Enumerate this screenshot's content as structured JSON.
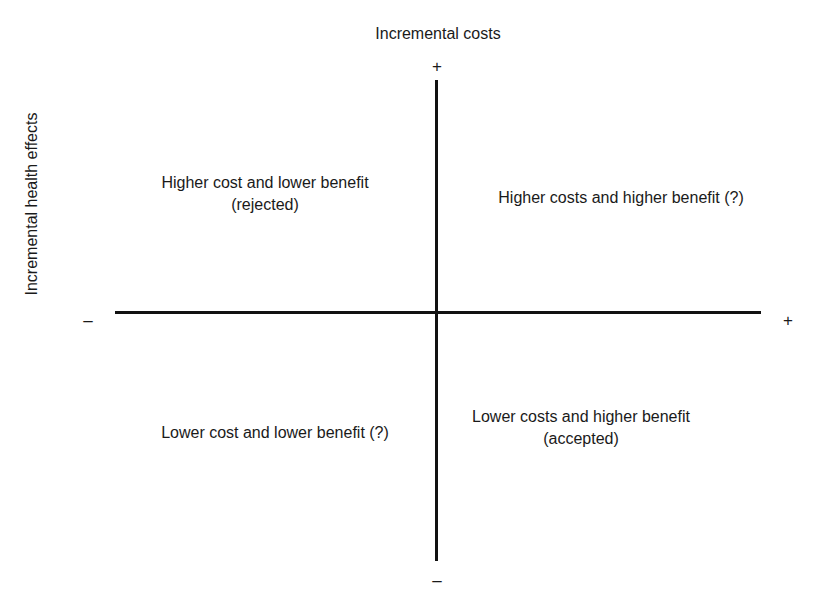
{
  "diagram": {
    "kind": "cost-effectiveness-plane",
    "background_color": "#ffffff",
    "line_color": "#111111",
    "text_color": "#1a1a1a"
  },
  "axes": {
    "vertical": {
      "title": "Incremental costs",
      "positive_sign": "+",
      "negative_sign": "–"
    },
    "horizontal": {
      "title": "Incremental health effects",
      "positive_sign": "+",
      "negative_sign": "–"
    }
  },
  "quadrants": {
    "top_left": {
      "line1": "Higher cost and lower benefit",
      "line2": "(rejected)"
    },
    "top_right": {
      "line1": "Higher costs and higher benefit (?)"
    },
    "bottom_left": {
      "line1": "Lower cost and lower benefit (?)"
    },
    "bottom_right": {
      "line1": "Lower costs and higher benefit",
      "line2": "(accepted)"
    }
  },
  "chart_data": {
    "type": "scatter",
    "title": "",
    "xlabel": "Incremental health effects",
    "ylabel": "Incremental costs",
    "x": [],
    "y": [],
    "xlim": [
      -1,
      1
    ],
    "ylim": [
      -1,
      1
    ],
    "grid": false,
    "legend": "none",
    "annotations": [
      {
        "quadrant": "top-left",
        "x_sign": "negative",
        "y_sign": "positive",
        "text": "Higher cost and lower benefit (rejected)"
      },
      {
        "quadrant": "top-right",
        "x_sign": "positive",
        "y_sign": "positive",
        "text": "Higher costs and higher benefit (?)"
      },
      {
        "quadrant": "bottom-left",
        "x_sign": "negative",
        "y_sign": "negative",
        "text": "Lower cost and lower benefit (?)"
      },
      {
        "quadrant": "bottom-right",
        "x_sign": "positive",
        "y_sign": "negative",
        "text": "Lower costs and higher benefit (accepted)"
      }
    ],
    "tick_labels": {
      "x": [
        "–",
        "+"
      ],
      "y": [
        "+",
        "–"
      ]
    }
  }
}
